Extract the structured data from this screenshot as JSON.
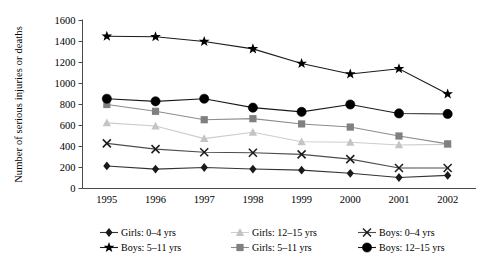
{
  "chart_data": {
    "type": "line",
    "title": "",
    "xlabel": "",
    "ylabel": "Number of serious injuries or deaths",
    "categories": [
      "1995",
      "1996",
      "1997",
      "1998",
      "1999",
      "2000",
      "2001",
      "2002"
    ],
    "x": [
      1995,
      1996,
      1997,
      1998,
      1999,
      2000,
      2001,
      2002
    ],
    "ylim": [
      0,
      1600
    ],
    "yticks": [
      0,
      200,
      400,
      600,
      800,
      1000,
      1200,
      1400,
      1600
    ],
    "ytick_labels": [
      "0",
      "200",
      "400",
      "600",
      "800",
      "1000",
      "1200",
      "1400",
      "1600"
    ],
    "grid": false,
    "legend_position": "bottom",
    "series": [
      {
        "name": "Girls: 0–4 yrs",
        "marker": "diamond",
        "color": "#1a1a1a",
        "line_color": "#333333",
        "values": [
          215,
          185,
          200,
          185,
          175,
          145,
          105,
          125
        ]
      },
      {
        "name": "Girls: 5–11 yrs",
        "marker": "square",
        "color": "#808080",
        "line_color": "#8c8c8c",
        "values": [
          800,
          735,
          655,
          665,
          615,
          585,
          500,
          425
        ]
      },
      {
        "name": "Girls: 12–15 yrs",
        "marker": "triangle",
        "color": "#c4c4c4",
        "line_color": "#cccccc",
        "values": [
          625,
          595,
          475,
          535,
          445,
          440,
          415,
          420
        ]
      },
      {
        "name": "Boys: 0–4 yrs",
        "marker": "cross",
        "color": "#1a1a1a",
        "line_color": "#4d4d4d",
        "values": [
          430,
          375,
          345,
          340,
          325,
          280,
          195,
          195
        ]
      },
      {
        "name": "Boys: 5–11 yrs",
        "marker": "star",
        "color": "#000000",
        "line_color": "#1a1a1a",
        "values": [
          1450,
          1445,
          1400,
          1330,
          1190,
          1090,
          1140,
          900
        ]
      },
      {
        "name": "Boys: 12–15 yrs",
        "marker": "circle",
        "color": "#000000",
        "line_color": "#1a1a1a",
        "values": [
          855,
          830,
          855,
          770,
          730,
          800,
          715,
          710
        ]
      }
    ]
  },
  "legend": {
    "items": [
      {
        "label": "Girls: 0–4 yrs"
      },
      {
        "label": "Girls: 12–15 yrs"
      },
      {
        "label": "Boys: 5–11 yrs"
      },
      {
        "label": "Girls: 5–11 yrs"
      },
      {
        "label": "Boys: 0–4 yrs"
      },
      {
        "label": "Boys: 12–15 yrs"
      }
    ]
  }
}
